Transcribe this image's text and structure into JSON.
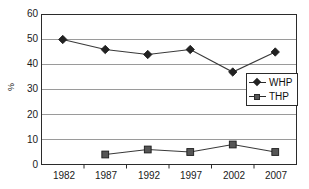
{
  "chart_data": {
    "type": "line",
    "title": "",
    "xlabel": "",
    "ylabel": "%",
    "categories": [
      "1982",
      "1987",
      "1992",
      "1997",
      "2002",
      "2007"
    ],
    "ylim": [
      0,
      60
    ],
    "ytick_labels": [
      "0",
      "10",
      "20",
      "30",
      "40",
      "50",
      "60"
    ],
    "ytick_values": [
      0,
      10,
      20,
      30,
      40,
      50,
      60
    ],
    "grid": "horizontal",
    "legend_position": "center-right",
    "series": [
      {
        "name": "WHP",
        "marker": "diamond",
        "color": "#222222",
        "values": [
          50,
          46,
          44,
          46,
          37,
          45
        ]
      },
      {
        "name": "THP",
        "marker": "square",
        "color": "#555555",
        "values": [
          null,
          4,
          6,
          5,
          8,
          5
        ]
      }
    ]
  },
  "legend": {
    "items": [
      {
        "label": "WHP",
        "marker": "diamond-marker-icon"
      },
      {
        "label": "THP",
        "marker": "square-marker-icon"
      }
    ]
  },
  "axes": {
    "y_title": "%",
    "y_labels": [
      "60",
      "50",
      "40",
      "30",
      "20",
      "10",
      "0"
    ],
    "x_labels": [
      "1982",
      "1987",
      "1992",
      "1997",
      "2002",
      "2007"
    ]
  }
}
